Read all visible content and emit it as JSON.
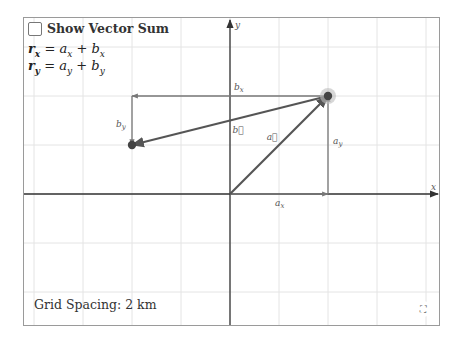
{
  "controls": {
    "show_vector_sum_label": "Show Vector Sum",
    "show_vector_sum_checked": false
  },
  "equations": {
    "rx": {
      "lhs": "r",
      "lhs_sub": "x",
      "rhs1": "a",
      "rhs1_sub": "x",
      "op": "+",
      "rhs2": "b",
      "rhs2_sub": "x",
      "eq": "="
    },
    "ry": {
      "lhs": "r",
      "lhs_sub": "y",
      "rhs1": "a",
      "rhs1_sub": "y",
      "op": "+",
      "rhs2": "b",
      "rhs2_sub": "y",
      "eq": "="
    }
  },
  "footer": {
    "grid_spacing_label": "Grid Spacing: 2 km"
  },
  "icons": {
    "fullscreen": "⛶"
  },
  "graph": {
    "axis_labels": {
      "x": "x",
      "y": "y"
    },
    "grid_spacing_px": 49,
    "origin_px": [
      206,
      176
    ],
    "point_a": [
      2,
      2
    ],
    "point_b": [
      -2,
      1
    ],
    "vector_labels": {
      "a": "a⃗",
      "b": "b⃗"
    },
    "component_labels": {
      "ax": "a",
      "ax_sub": "x",
      "ay": "a",
      "ay_sub": "y",
      "bx": "b",
      "bx_sub": "x",
      "by": "b",
      "by_sub": "y"
    },
    "colors": {
      "grid": "#e4e4e4",
      "axis": "#333333",
      "vector": "#555555",
      "component": "#777777",
      "point": "#444444",
      "point_halo": "#bdbdbd"
    }
  }
}
